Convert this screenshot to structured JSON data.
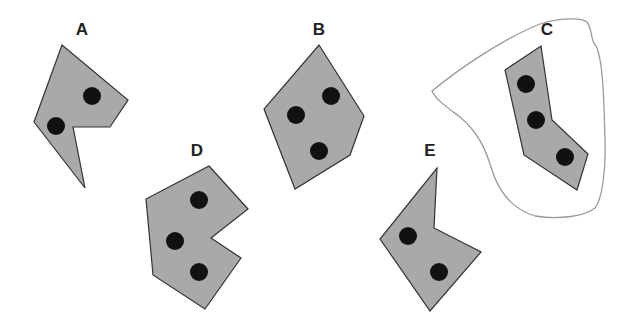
{
  "diagram": {
    "colors": {
      "shape_fill": "#a9a9a9",
      "shape_stroke": "#333333",
      "dot": "#111111",
      "blob_stroke": "#999999",
      "label": "#222222"
    },
    "shapes": [
      {
        "id": "A",
        "label": "A",
        "label_pos": [
          82,
          29
        ],
        "points": [
          [
            62,
            45
          ],
          [
            128,
            100
          ],
          [
            110,
            127
          ],
          [
            73,
            127
          ],
          [
            85,
            188
          ],
          [
            34,
            122
          ]
        ],
        "dots": [
          [
            92,
            96
          ],
          [
            56,
            126
          ]
        ]
      },
      {
        "id": "B",
        "label": "B",
        "label_pos": [
          319,
          29
        ],
        "points": [
          [
            319,
            45
          ],
          [
            364,
            116
          ],
          [
            350,
            155
          ],
          [
            295,
            189
          ],
          [
            264,
            109
          ]
        ],
        "dots": [
          [
            331,
            96
          ],
          [
            296,
            115
          ],
          [
            319,
            151
          ]
        ]
      },
      {
        "id": "C",
        "label": "C",
        "label_pos": [
          547,
          29
        ],
        "points": [
          [
            541,
            46
          ],
          [
            552,
            120
          ],
          [
            588,
            154
          ],
          [
            577,
            190
          ],
          [
            524,
            155
          ],
          [
            505,
            70
          ]
        ],
        "dots": [
          [
            526,
            84
          ],
          [
            536,
            120
          ],
          [
            565,
            157
          ]
        ],
        "enclosed_by_outline": true
      },
      {
        "id": "D",
        "label": "D",
        "label_pos": [
          197,
          150
        ],
        "points": [
          [
            209,
            166
          ],
          [
            248,
            209
          ],
          [
            211,
            238
          ],
          [
            241,
            258
          ],
          [
            205,
            309
          ],
          [
            153,
            275
          ],
          [
            146,
            199
          ]
        ],
        "dots": [
          [
            199,
            200
          ],
          [
            175,
            241
          ],
          [
            199,
            272
          ]
        ]
      },
      {
        "id": "E",
        "label": "E",
        "label_pos": [
          430,
          150
        ],
        "points": [
          [
            437,
            168
          ],
          [
            434,
            228
          ],
          [
            481,
            252
          ],
          [
            430,
            311
          ],
          [
            380,
            239
          ]
        ],
        "dots": [
          [
            408,
            236
          ],
          [
            439,
            272
          ]
        ]
      }
    ],
    "dot_radius": 9
  }
}
